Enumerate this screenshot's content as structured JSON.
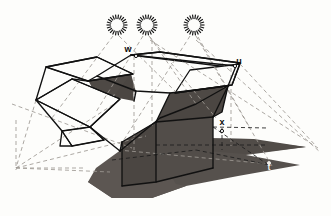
{
  "figure": {
    "background_color": "#fdfdfb",
    "outline_color": "#111111",
    "shadow_color": "#56514d",
    "shadow_color_secondary": "#5f5955",
    "dashed_line_color": "#9a9590",
    "dashed_line_color_dark": "#2b2b2b"
  },
  "labels": [
    {
      "id": "w",
      "text": "w",
      "x": 128,
      "y": 52,
      "style": "dark",
      "meaning": "near-top corner of box opening"
    },
    {
      "id": "u",
      "text": "u",
      "x": 239,
      "y": 64,
      "style": "dark",
      "meaning": "far-right corner of box opening"
    },
    {
      "id": "x",
      "text": "x",
      "x": 222,
      "y": 125,
      "style": "dark",
      "meaning": "base point on vertical edge of box"
    },
    {
      "id": "t",
      "text": "t",
      "x": 269,
      "y": 170,
      "style": "light",
      "meaning": "shadow of point x on ground plane"
    }
  ],
  "light_sources": [
    {
      "id": "light-1",
      "cx": 117,
      "cy": 25,
      "r_inner": 6.0,
      "r_outer": 10.5,
      "rays": 22
    },
    {
      "id": "light-2",
      "cx": 147,
      "cy": 25,
      "r_inner": 6.0,
      "r_outer": 10.5,
      "rays": 22
    },
    {
      "id": "light-3",
      "cx": 194,
      "cy": 25,
      "r_inner": 6.0,
      "r_outer": 10.5,
      "rays": 22
    }
  ],
  "geometry": {
    "shadow_ground": "M 100 168 L 128 150 L 196 151 L 196 143 L 252 143 L 300 148 L 252 154 L 302 165 L 252 176 L 186 186 L 150 196 L 118 196 L 92 182 Z",
    "shadow_box_left": "M 95 168 L 140 136 L 166 139 L 160 158 L 176 186 L 122 186 Z",
    "box_front_dark": "M 156 122 L 213 117 L 213 168 L 156 182 Z",
    "box_left_dark": "M 122 141 L 156 122 L 156 182 L 122 186 Z",
    "box_inner_right": "M 156 122 L 213 117 L 228 86 L 170 93 Z",
    "box_inner_top_left": "M 88 80 L 128 57 L 136 89 L 100 97 Z",
    "box_inner_wedge": "M 130 74 L 132 99 L 112 96 Z",
    "flap_top_left_white": "M 46 66 L 97 57 L 133 74 L 88 88 Z",
    "flap_top_right_white": "M 131 55 L 228 66 L 240 62 L 160 52 Z",
    "flap_left_white": "M 36 100 L 72 79 L 120 98 L 90 127 Z",
    "flap_right_white": "M 175 92 L 232 84 L 240 64 L 188 70 Z"
  },
  "line_styles": {
    "solid_outline_width": 1.3,
    "dashed_width": 0.8,
    "dash_pattern": "4,3",
    "dash_pattern_fine": "3,2.5"
  }
}
